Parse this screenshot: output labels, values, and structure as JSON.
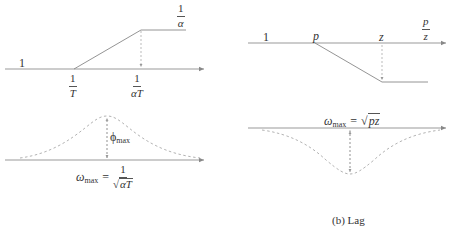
{
  "panels": [
    {
      "id": "lead",
      "top_plot": {
        "type": "asymptotic-magnitude",
        "low_level_label": "1",
        "break_labels": [
          {
            "num": "1",
            "den": "T"
          },
          {
            "num": "1",
            "den": "αT"
          }
        ],
        "high_level_label": {
          "num": "1",
          "den": "α"
        }
      },
      "bottom_plot": {
        "type": "phase-bump-up",
        "peak_label": "ϕ",
        "peak_label_sub": "max",
        "omega_label": "ω",
        "omega_sub": "max",
        "equals": "=",
        "formula": {
          "num": "1",
          "den_radicand": "αT"
        }
      },
      "caption": ""
    },
    {
      "id": "lag",
      "top_plot": {
        "type": "asymptotic-magnitude",
        "low_level_label": "1",
        "break_labels": [
          "p",
          "z"
        ],
        "high_level_label": {
          "num": "p",
          "den": "z"
        }
      },
      "bottom_plot": {
        "type": "phase-dip-down",
        "omega_label": "ω",
        "omega_sub": "max",
        "equals": "=",
        "formula_radicand": "pz"
      },
      "caption": "(b) Lag"
    }
  ],
  "colors": {
    "line": "#888888",
    "dashed": "#aaaaaa",
    "text": "#333333"
  }
}
